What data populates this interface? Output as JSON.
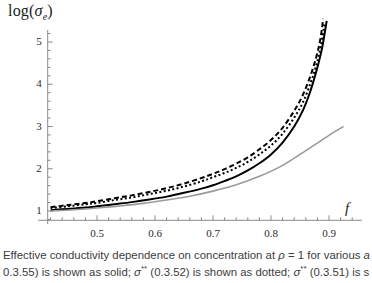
{
  "figure": {
    "y_axis_label": "log(",
    "y_axis_label_symbol": "σ",
    "y_axis_label_subscript": "e",
    "y_axis_label_close": ")",
    "x_axis_label": "f"
  },
  "caption": {
    "line1_pre": "Effective conductivity dependence on concentration at ",
    "line1_rho": "ρ",
    "line1_mid": " = 1 for various ",
    "line1_tail": "a",
    "line2_pre": "0.3.55) is shown as solid; ",
    "line2_sym1": "σ",
    "line2_sup1": "**",
    "line2_mid1": " (0.3.52) is shown as dotted; ",
    "line2_sym2": "σ",
    "line2_sup2": "**",
    "line2_mid2": " (0.3.51) is s"
  },
  "chart_data": {
    "type": "line",
    "title": "",
    "xlabel": "f",
    "ylabel": "log(σ_e)",
    "xlim": [
      0.42,
      0.94
    ],
    "ylim": [
      0.78,
      5.95
    ],
    "xticks": [
      0.5,
      0.6,
      0.7,
      0.8,
      0.9
    ],
    "xtick_labels": [
      "0.5",
      "0.6",
      "0.7",
      "0.8",
      "0.9"
    ],
    "yticks": [
      1,
      2,
      3,
      4,
      5
    ],
    "ytick_labels": [
      "1",
      "2",
      "3",
      "4",
      "5"
    ],
    "minor_ticks": true,
    "grid": false,
    "legend": null,
    "axis_color": "#8a8a8a",
    "series": [
      {
        "name": "dashed-upper",
        "style": "dashed",
        "color": "#000000",
        "width": 2.0,
        "x": [
          0.42,
          0.45,
          0.48,
          0.5,
          0.53,
          0.56,
          0.59,
          0.62,
          0.65,
          0.68,
          0.7,
          0.72,
          0.74,
          0.76,
          0.78,
          0.8,
          0.82,
          0.84,
          0.855,
          0.868,
          0.878,
          0.885,
          0.89
        ],
        "y": [
          1.09,
          1.14,
          1.19,
          1.23,
          1.3,
          1.37,
          1.45,
          1.54,
          1.65,
          1.78,
          1.88,
          1.99,
          2.12,
          2.27,
          2.46,
          2.68,
          2.97,
          3.37,
          3.75,
          4.2,
          4.64,
          5.06,
          5.55
        ]
      },
      {
        "name": "dotted-middle",
        "style": "dotted",
        "color": "#000000",
        "width": 2.0,
        "x": [
          0.42,
          0.45,
          0.48,
          0.5,
          0.53,
          0.56,
          0.59,
          0.62,
          0.65,
          0.68,
          0.7,
          0.72,
          0.74,
          0.76,
          0.78,
          0.8,
          0.82,
          0.84,
          0.855,
          0.868,
          0.878,
          0.886,
          0.892
        ],
        "y": [
          1.07,
          1.11,
          1.16,
          1.19,
          1.26,
          1.32,
          1.4,
          1.48,
          1.58,
          1.7,
          1.8,
          1.9,
          2.02,
          2.16,
          2.34,
          2.55,
          2.83,
          3.21,
          3.57,
          4.02,
          4.45,
          4.9,
          5.42
        ]
      },
      {
        "name": "solid-black",
        "style": "solid",
        "color": "#000000",
        "width": 2.0,
        "x": [
          0.42,
          0.45,
          0.48,
          0.5,
          0.53,
          0.56,
          0.59,
          0.62,
          0.65,
          0.68,
          0.7,
          0.72,
          0.74,
          0.76,
          0.78,
          0.8,
          0.82,
          0.84,
          0.855,
          0.868,
          0.878,
          0.888,
          0.896
        ],
        "y": [
          1.02,
          1.05,
          1.08,
          1.11,
          1.16,
          1.21,
          1.27,
          1.34,
          1.43,
          1.53,
          1.61,
          1.71,
          1.82,
          1.96,
          2.13,
          2.34,
          2.62,
          3.0,
          3.38,
          3.84,
          4.3,
          4.85,
          5.5
        ]
      },
      {
        "name": "solid-gray",
        "style": "solid",
        "color": "#9a9a9a",
        "width": 1.6,
        "x": [
          0.42,
          0.46,
          0.5,
          0.54,
          0.58,
          0.62,
          0.66,
          0.7,
          0.74,
          0.78,
          0.82,
          0.86,
          0.89,
          0.91,
          0.925
        ],
        "y": [
          1.0,
          1.03,
          1.07,
          1.12,
          1.18,
          1.26,
          1.35,
          1.47,
          1.62,
          1.82,
          2.08,
          2.43,
          2.7,
          2.88,
          3.0
        ]
      }
    ]
  }
}
